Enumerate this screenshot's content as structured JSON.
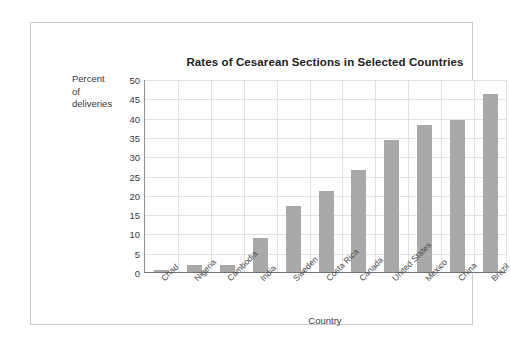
{
  "figure": {
    "title": "Rates of Cesarean Sections in Selected Countries",
    "x_axis_title": "Country",
    "y_axis_title_lines": [
      "Percent",
      "of",
      "deliveries"
    ],
    "bar_color": "#a9a9a9",
    "grid_color": "#dfe2e5",
    "frame_color": "#c9cdd1"
  },
  "chart_data": {
    "type": "bar",
    "title": "Rates of Cesarean Sections in Selected Countries",
    "xlabel": "Country",
    "ylabel": "Percent of deliveries",
    "ylim": [
      0,
      50
    ],
    "yticks": [
      0,
      5,
      10,
      15,
      20,
      25,
      30,
      35,
      40,
      45,
      50
    ],
    "ytick_labels": [
      "0",
      "5",
      "10",
      "15",
      "20",
      "25",
      "30",
      "35",
      "40",
      "45",
      "50"
    ],
    "grid": true,
    "legend": false,
    "categories": [
      "Chad",
      "Nigeria",
      "Cambodia",
      "India",
      "Sweden",
      "Costa Rica",
      "Canada",
      "United States",
      "Mexico",
      "China",
      "Brazil"
    ],
    "values": [
      0.4,
      1.8,
      1.8,
      8.7,
      17.0,
      21.0,
      26.5,
      34.3,
      38.0,
      39.5,
      46.0
    ]
  }
}
